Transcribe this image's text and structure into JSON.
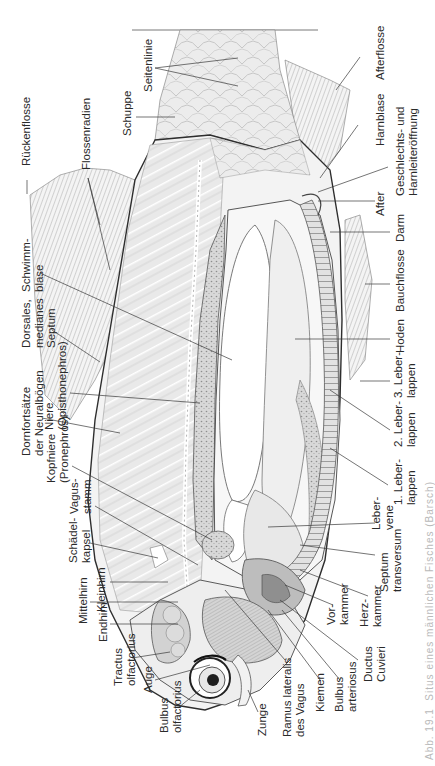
{
  "figure": {
    "orientation": "rotated-90-ccw",
    "caption": "Abb. 19.1  Situs eines männlichen Fisches (Barsch)",
    "labels": {
      "seitenlinie": "Seitenlinie",
      "afterflosse": "Afterflosse",
      "schuppe": "Schuppe",
      "harnblase": "Harnblase",
      "rueckenflosse": "Rückenflosse",
      "flossenradien": "Flossenradien",
      "geschlechtsoeffnung": "Geschlechts- und\nHarnleiteröffnung",
      "after": "After",
      "darm": "Darm",
      "schwimmblase": "Schwimm-\nblase",
      "bauchflosse": "Bauchflosse",
      "dorsales_septum": "Dorsales,\nmedianes\nSeptum",
      "hoden": "Hoden",
      "niere": "Niere\n(Opisthonephros)",
      "dornfortsaetze": "Dornfortsätze\nder Neuralbögen",
      "leberlappen_3": "3. Leber-\nlappen",
      "leberlappen_2": "2. Leber-\nlappen",
      "kopfniere": "Kopfniere\n(Pronephros)",
      "leberlappen_1": "1. Leber-\nlappen",
      "vagusstamm": "Vagus-\nstamm",
      "lebervene": "Leber-\nvene",
      "schaedelkapsel": "Schädel-\nkapsel",
      "septum_transversum": "Septum\ntransversum",
      "kleinhirn": "Kleinhirn",
      "mittelhirn": "Mittelhirn",
      "herzkammer": "Herz-\nkammer",
      "vorkammer": "Vor-\nkammer",
      "endhirn": "Endhirn",
      "tractus_olfactorius": "Tractus\nolfactorius",
      "ductus_cuvieri": "Ductus\nCuvieri",
      "auge": "Auge",
      "bulbus_arteriosus": "Bulbus\narteriosus",
      "kiemen": "Kiemen",
      "bulbus_olfactorius": "Bulbus\nolfactorius",
      "ramus_lateralis": "Ramus lateralis\ndes Vagus",
      "zunge": "Zunge"
    }
  },
  "colors": {
    "ink": "#2a2a2a",
    "line": "#3a3a3a",
    "shade_light": "#e6e6e6",
    "shade_mid": "#c8c8c8",
    "shade_dark": "#8a8a8a",
    "caption": "#b9b9b9"
  }
}
